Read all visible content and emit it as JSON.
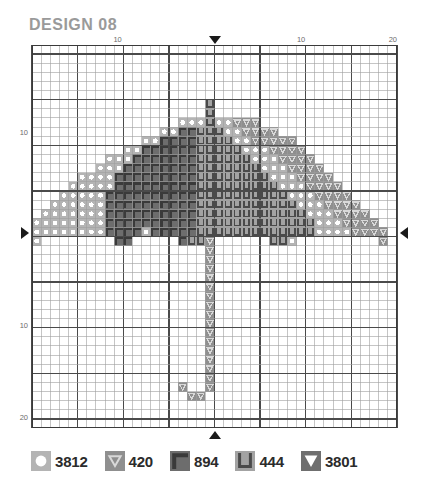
{
  "header": {
    "title": "DESIGN 08"
  },
  "chart_data": {
    "type": "heatmap",
    "title": "DESIGN 08",
    "subtitle": "",
    "xlabel": "",
    "ylabel": "",
    "grid": true,
    "legend_position": "bottom",
    "columns": 40,
    "rows": 42,
    "cell_px": 9.175,
    "bold_every": 5,
    "center_column": 20,
    "center_row": 21,
    "axis": {
      "top_ticks": [
        {
          "value": "10",
          "col": 10
        },
        {
          "value": "10",
          "col": 30
        },
        {
          "value": "20",
          "col": 40
        }
      ],
      "left_ticks": [
        {
          "value": "10",
          "row": 10
        },
        {
          "value": "10",
          "row": 31
        },
        {
          "value": "20",
          "row": 41
        }
      ],
      "center_markers": [
        "top",
        "left",
        "right",
        "bottom"
      ]
    },
    "palette": [
      {
        "code": "3812",
        "symbol": "circle",
        "fill": "#b4b4b4",
        "mark": "#ffffff"
      },
      {
        "code": "420",
        "symbol": "triangle-open",
        "fill": "#8f8f8f",
        "mark": "#d9d9d9"
      },
      {
        "code": "894",
        "symbol": "corner",
        "fill": "#6d6d6d",
        "mark": "#3a3a3a"
      },
      {
        "code": "444",
        "symbol": "u-shape",
        "fill": "#a3a3a3",
        "mark": "#4a4a4a"
      },
      {
        "code": "3801",
        "symbol": "triangle-solid",
        "fill": "#6f6f6f",
        "mark": "#ffffff"
      }
    ],
    "legend": [
      {
        "code": "3812",
        "symbol": "circle"
      },
      {
        "code": "420",
        "symbol": "triangle-open"
      },
      {
        "code": "894",
        "symbol": "corner"
      },
      {
        "code": "444",
        "symbol": "u-shape"
      },
      {
        "code": "3801",
        "symbol": "triangle-solid"
      }
    ],
    "stitches": [
      {
        "row": 7,
        "code": "444",
        "cols": [
          20
        ]
      },
      {
        "row": 8,
        "code": "444",
        "cols": [
          20
        ]
      },
      {
        "row": 9,
        "code": "3812",
        "cols": [
          17,
          18,
          19,
          21,
          22
        ]
      },
      {
        "row": 9,
        "code": "444",
        "cols": [
          20
        ]
      },
      {
        "row": 9,
        "code": "420",
        "cols": [
          23,
          24,
          25
        ]
      },
      {
        "row": 10,
        "code": "3812",
        "cols": [
          15,
          16
        ]
      },
      {
        "row": 10,
        "code": "894",
        "cols": [
          17,
          18
        ]
      },
      {
        "row": 10,
        "code": "444",
        "cols": [
          19,
          20,
          21
        ]
      },
      {
        "row": 10,
        "code": "3812",
        "cols": [
          22,
          23
        ]
      },
      {
        "row": 10,
        "code": "420",
        "cols": [
          24,
          25,
          26,
          27
        ]
      },
      {
        "row": 11,
        "code": "3812",
        "cols": [
          13,
          14
        ]
      },
      {
        "row": 11,
        "code": "894",
        "cols": [
          15,
          16,
          17,
          18
        ]
      },
      {
        "row": 11,
        "code": "444",
        "cols": [
          19,
          20,
          21,
          22
        ]
      },
      {
        "row": 11,
        "code": "3812",
        "cols": [
          23,
          24
        ]
      },
      {
        "row": 11,
        "code": "420",
        "cols": [
          25,
          26,
          27,
          28,
          29
        ]
      },
      {
        "row": 12,
        "code": "3812",
        "cols": [
          11,
          12
        ]
      },
      {
        "row": 12,
        "code": "894",
        "cols": [
          13,
          14,
          15,
          16,
          17,
          18
        ]
      },
      {
        "row": 12,
        "code": "444",
        "cols": [
          19,
          20,
          21,
          22,
          23
        ]
      },
      {
        "row": 12,
        "code": "3812",
        "cols": [
          24,
          25,
          26
        ]
      },
      {
        "row": 12,
        "code": "420",
        "cols": [
          27,
          28,
          29,
          30
        ]
      },
      {
        "row": 13,
        "code": "3812",
        "cols": [
          9,
          10,
          11
        ]
      },
      {
        "row": 13,
        "code": "894",
        "cols": [
          12,
          13,
          14,
          15,
          16,
          17,
          18
        ]
      },
      {
        "row": 13,
        "code": "444",
        "cols": [
          19,
          20,
          21,
          22,
          23,
          24
        ]
      },
      {
        "row": 13,
        "code": "3812",
        "cols": [
          25,
          26,
          27
        ]
      },
      {
        "row": 13,
        "code": "420",
        "cols": [
          28,
          29,
          30,
          31
        ]
      },
      {
        "row": 14,
        "code": "3812",
        "cols": [
          8,
          9,
          10
        ]
      },
      {
        "row": 14,
        "code": "894",
        "cols": [
          11,
          12,
          13,
          14,
          15,
          16,
          17,
          18
        ]
      },
      {
        "row": 14,
        "code": "444",
        "cols": [
          19,
          20,
          21,
          22,
          23,
          24,
          25
        ]
      },
      {
        "row": 14,
        "code": "3812",
        "cols": [
          26,
          27,
          28
        ]
      },
      {
        "row": 14,
        "code": "420",
        "cols": [
          29,
          30,
          31,
          32
        ]
      },
      {
        "row": 15,
        "code": "3812",
        "cols": [
          6,
          7,
          8,
          9
        ]
      },
      {
        "row": 15,
        "code": "894",
        "cols": [
          10,
          11,
          12,
          13,
          14,
          15,
          16,
          17,
          18
        ]
      },
      {
        "row": 15,
        "code": "444",
        "cols": [
          19,
          20,
          21,
          22,
          23,
          24,
          25,
          26
        ]
      },
      {
        "row": 15,
        "code": "3812",
        "cols": [
          27,
          28,
          29
        ]
      },
      {
        "row": 15,
        "code": "420",
        "cols": [
          30,
          31,
          32,
          33
        ]
      },
      {
        "row": 16,
        "code": "3812",
        "cols": [
          5,
          6,
          7,
          8,
          9
        ]
      },
      {
        "row": 16,
        "code": "894",
        "cols": [
          10,
          11,
          12,
          13,
          14,
          15,
          16,
          17,
          18
        ]
      },
      {
        "row": 16,
        "code": "444",
        "cols": [
          19,
          20,
          21,
          22,
          23,
          24,
          25,
          26,
          27
        ]
      },
      {
        "row": 16,
        "code": "3812",
        "cols": [
          28,
          29,
          30
        ]
      },
      {
        "row": 16,
        "code": "420",
        "cols": [
          31,
          32,
          33,
          34
        ]
      },
      {
        "row": 17,
        "code": "3812",
        "cols": [
          4,
          5,
          6,
          7,
          8
        ]
      },
      {
        "row": 17,
        "code": "894",
        "cols": [
          9,
          10,
          11,
          12,
          13,
          14,
          15,
          16,
          17,
          18
        ]
      },
      {
        "row": 17,
        "code": "444",
        "cols": [
          19,
          20,
          21,
          22,
          23,
          24,
          25,
          26,
          27,
          28
        ]
      },
      {
        "row": 17,
        "code": "3812",
        "cols": [
          29,
          30,
          31
        ]
      },
      {
        "row": 17,
        "code": "420",
        "cols": [
          32,
          33,
          34,
          35
        ]
      },
      {
        "row": 18,
        "code": "3812",
        "cols": [
          3,
          4,
          5,
          6,
          7,
          8
        ]
      },
      {
        "row": 18,
        "code": "894",
        "cols": [
          9,
          10,
          11,
          12,
          13,
          14,
          15,
          16,
          17,
          18
        ]
      },
      {
        "row": 18,
        "code": "444",
        "cols": [
          19,
          20,
          21,
          22,
          23,
          24,
          25,
          26,
          27,
          28,
          29
        ]
      },
      {
        "row": 18,
        "code": "3812",
        "cols": [
          30,
          31,
          32
        ]
      },
      {
        "row": 18,
        "code": "420",
        "cols": [
          33,
          34,
          35,
          36
        ]
      },
      {
        "row": 19,
        "code": "3812",
        "cols": [
          2,
          3,
          4,
          5,
          6,
          7,
          8
        ]
      },
      {
        "row": 19,
        "code": "894",
        "cols": [
          9,
          10,
          11,
          12,
          13,
          14,
          15,
          16,
          17,
          18
        ]
      },
      {
        "row": 19,
        "code": "444",
        "cols": [
          19,
          20,
          21,
          22,
          23,
          24,
          25,
          26,
          27,
          28,
          29,
          30
        ]
      },
      {
        "row": 19,
        "code": "3812",
        "cols": [
          31,
          32,
          33
        ]
      },
      {
        "row": 19,
        "code": "420",
        "cols": [
          34,
          35,
          36,
          37
        ]
      },
      {
        "row": 20,
        "code": "3812",
        "cols": [
          1,
          2,
          3,
          4,
          5,
          6,
          7,
          8
        ]
      },
      {
        "row": 20,
        "code": "894",
        "cols": [
          9,
          10,
          11,
          12,
          13,
          14,
          15,
          16,
          17,
          18
        ]
      },
      {
        "row": 20,
        "code": "444",
        "cols": [
          19,
          20,
          21,
          22,
          23,
          24,
          25,
          26,
          27,
          28,
          29,
          30,
          31
        ]
      },
      {
        "row": 20,
        "code": "3812",
        "cols": [
          32,
          33,
          34
        ]
      },
      {
        "row": 20,
        "code": "420",
        "cols": [
          35,
          36,
          37,
          38
        ]
      },
      {
        "row": 21,
        "code": "3812",
        "cols": [
          1,
          2,
          3,
          4,
          5,
          6,
          7,
          8
        ]
      },
      {
        "row": 21,
        "code": "894",
        "cols": [
          9,
          10,
          11,
          12
        ]
      },
      {
        "row": 21,
        "code": "3812",
        "cols": [
          13
        ]
      },
      {
        "row": 21,
        "code": "894",
        "cols": [
          14,
          15,
          16,
          17,
          18
        ]
      },
      {
        "row": 21,
        "code": "444",
        "cols": [
          19,
          20,
          21,
          22,
          23,
          24,
          25,
          26,
          27,
          28,
          29,
          30,
          31
        ]
      },
      {
        "row": 21,
        "code": "3812",
        "cols": [
          32,
          33,
          34,
          35
        ]
      },
      {
        "row": 21,
        "code": "420",
        "cols": [
          36,
          37,
          38,
          39
        ]
      },
      {
        "row": 22,
        "code": "3812",
        "cols": [
          1
        ]
      },
      {
        "row": 22,
        "code": "894",
        "cols": [
          10,
          11
        ]
      },
      {
        "row": 22,
        "code": "894",
        "cols": [
          17
        ]
      },
      {
        "row": 22,
        "code": "444",
        "cols": [
          18,
          19
        ]
      },
      {
        "row": 22,
        "code": "420",
        "cols": [
          20
        ]
      },
      {
        "row": 22,
        "code": "444",
        "cols": [
          27,
          28
        ]
      },
      {
        "row": 22,
        "code": "3812",
        "cols": [
          29
        ]
      },
      {
        "row": 22,
        "code": "420",
        "cols": [
          39
        ]
      },
      {
        "row": 23,
        "code": "420",
        "cols": [
          20
        ]
      },
      {
        "row": 24,
        "code": "420",
        "cols": [
          20
        ]
      },
      {
        "row": 25,
        "code": "420",
        "cols": [
          20
        ]
      },
      {
        "row": 26,
        "code": "420",
        "cols": [
          20
        ]
      },
      {
        "row": 27,
        "code": "420",
        "cols": [
          20
        ]
      },
      {
        "row": 28,
        "code": "420",
        "cols": [
          20
        ]
      },
      {
        "row": 29,
        "code": "420",
        "cols": [
          20
        ]
      },
      {
        "row": 30,
        "code": "420",
        "cols": [
          20
        ]
      },
      {
        "row": 31,
        "code": "420",
        "cols": [
          20
        ]
      },
      {
        "row": 32,
        "code": "420",
        "cols": [
          20
        ]
      },
      {
        "row": 33,
        "code": "420",
        "cols": [
          20
        ]
      },
      {
        "row": 34,
        "code": "420",
        "cols": [
          20
        ]
      },
      {
        "row": 35,
        "code": "420",
        "cols": [
          20
        ]
      },
      {
        "row": 36,
        "code": "420",
        "cols": [
          20
        ]
      },
      {
        "row": 37,
        "code": "420",
        "cols": [
          20
        ]
      },
      {
        "row": 38,
        "code": "420",
        "cols": [
          17,
          20
        ]
      },
      {
        "row": 39,
        "code": "420",
        "cols": [
          18,
          19
        ]
      }
    ]
  }
}
